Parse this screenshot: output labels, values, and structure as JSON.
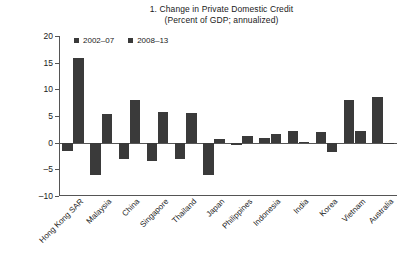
{
  "title": {
    "line1": "1. Change in Private Domestic Credit",
    "line2": "(Percent of GDP; annualized)"
  },
  "legend": {
    "items": [
      {
        "label": "2002–07",
        "color": "#3a3a3a"
      },
      {
        "label": "2008–13",
        "color": "#3a3a3a"
      }
    ]
  },
  "axis": {
    "y_ticks": [
      "20",
      "15",
      "10",
      "5",
      "0",
      "–5",
      "–10"
    ]
  },
  "chart_data": {
    "type": "bar",
    "title": "1. Change in Private Domestic Credit",
    "subtitle": "(Percent of GDP; annualized)",
    "xlabel": "",
    "ylabel": "Percent of GDP; annualized",
    "ylim": [
      -10,
      20
    ],
    "ytick_values": [
      20,
      15,
      10,
      5,
      0,
      -5,
      -10
    ],
    "grid": false,
    "legend_position": "top-left",
    "categories": [
      "Hong Kong SAR",
      "Malaysia",
      "China",
      "Singapore",
      "Thailand",
      "Japan",
      "Philippines",
      "Indonesia",
      "India",
      "Korea",
      "Vietnam",
      "Australia"
    ],
    "series": [
      {
        "name": "2002–07",
        "color": "#3a3a3a",
        "values": [
          -1.6,
          -6.0,
          -3.0,
          -3.5,
          -3.0,
          -6.0,
          -0.5,
          0.9,
          2.1,
          2.0,
          8.0,
          8.6
        ]
      },
      {
        "name": "2008–13",
        "color": "#3a3a3a",
        "values": [
          15.8,
          5.3,
          8.0,
          5.8,
          5.5,
          0.7,
          1.2,
          1.6,
          0.2,
          -1.8,
          2.2,
          -0.3
        ]
      }
    ]
  }
}
